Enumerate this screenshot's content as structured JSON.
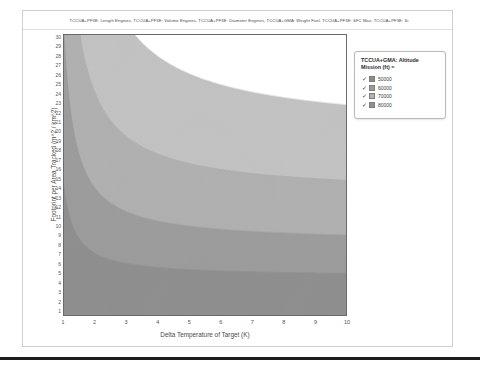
{
  "window": {
    "title": "TCCUA+PF3E: Length Engines, TCCUA+PF3E: Volume Engines, TCCUA+PF3E: Diameter Engines, TCCUA+GMA: Weight Fuel, TCCUA+PF3E: SFC Max, TCCUA+PF3E: Si"
  },
  "legend": {
    "title_line1": "TCCUA+GMA: Altitude",
    "title_line2": "Mission (ft) =",
    "check_glyph": "✓",
    "items": [
      {
        "label": "50000",
        "color": "#8c8c8c",
        "checked": true
      },
      {
        "label": "60000",
        "color": "#9c9c9c",
        "checked": true
      },
      {
        "label": "70000",
        "color": "#b3b3b3",
        "checked": true
      },
      {
        "label": "80000",
        "color": "#8f8f8f",
        "checked": true
      }
    ]
  },
  "chart_data": {
    "type": "heatmap",
    "xlabel": "Delta Temperature of Target (K)",
    "ylabel": "Footprint per Area Tracked (m^2 / km^2)",
    "xlim": [
      1,
      10
    ],
    "ylim": [
      1,
      30
    ],
    "grid": false,
    "legend_position": "right",
    "xticks": [
      "1",
      "2",
      "3",
      "4",
      "5",
      "6",
      "7",
      "8",
      "9",
      "10"
    ],
    "yticks": [
      "30",
      "29",
      "28",
      "27",
      "26",
      "25",
      "24",
      "23",
      "22",
      "21",
      "20",
      "19",
      "18",
      "17",
      "16",
      "15",
      "14",
      "13",
      "12",
      "11",
      "10",
      "9",
      "8",
      "7",
      "6",
      "5",
      "4",
      "3",
      "2",
      "1"
    ],
    "bands": [
      {
        "name": "80000",
        "color": "#8f8f8f",
        "k": 3.2,
        "floor": 5.0
      },
      {
        "name": "70000",
        "color": "#9c9c9c",
        "k": 7.5,
        "floor": 8.5
      },
      {
        "name": "60000",
        "color": "#b0b0b0",
        "k": 14.0,
        "floor": 13.5
      },
      {
        "name": "50000",
        "color": "#c2c2c2",
        "k": 26.0,
        "floor": 20.0
      },
      {
        "name": "above",
        "color": "#ffffff",
        "k": 0,
        "floor": 0
      }
    ]
  },
  "axes": {
    "x_title": "Delta Temperature of Target (K)",
    "y_title": "Footprint per Area Tracked (m^2 / km^2)"
  }
}
